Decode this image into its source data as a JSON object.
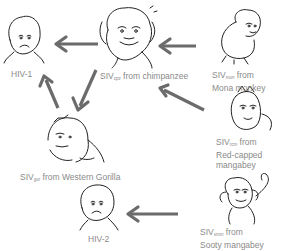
{
  "diagram": {
    "nodes": [
      {
        "id": "hiv1",
        "label": "HIV-1",
        "icon": "sad-human-face"
      },
      {
        "id": "siv_cpz",
        "prefix": "SIV",
        "sub": "cpz",
        "suffix": " from chimpanzee",
        "icon": "chimpanzee"
      },
      {
        "id": "siv_mon",
        "prefix": "SIV",
        "sub": "mon",
        "suffix": " from",
        "line2": "Mona monkey",
        "icon": "mona-monkey"
      },
      {
        "id": "siv_rcm",
        "prefix": "SIV",
        "sub": "rcm",
        "suffix": " from",
        "line2": "Red-capped",
        "line3": "mangabey",
        "icon": "red-capped-mangabey"
      },
      {
        "id": "siv_gor",
        "prefix": "SIV",
        "sub": "gor",
        "suffix": " from Western Gorilla",
        "icon": "gorilla"
      },
      {
        "id": "siv_smm",
        "prefix": "SIV",
        "sub": "smm",
        "suffix": " from",
        "line2": "Sooty mangabey",
        "icon": "sooty-mangabey"
      },
      {
        "id": "hiv2",
        "label": "HIV-2",
        "icon": "sad-human-face"
      }
    ],
    "edges": [
      {
        "from": "siv_cpz",
        "to": "hiv1"
      },
      {
        "from": "siv_mon",
        "to": "siv_cpz"
      },
      {
        "from": "siv_rcm",
        "to": "siv_cpz"
      },
      {
        "from": "siv_cpz",
        "to": "siv_gor"
      },
      {
        "from": "siv_gor",
        "to": "hiv1"
      },
      {
        "from": "siv_smm",
        "to": "hiv2"
      }
    ],
    "colors": {
      "arrow": "#6b6b6b",
      "text": "#8a8a8a",
      "line": "#222222"
    }
  }
}
